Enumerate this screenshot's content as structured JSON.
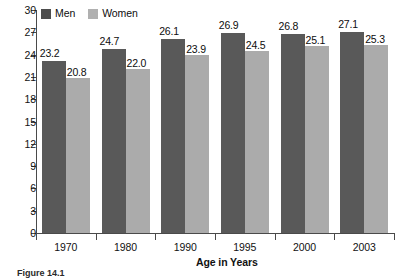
{
  "chart_data": {
    "type": "bar",
    "title": "",
    "xlabel": "Age in Years",
    "ylabel": "",
    "categories": [
      "1970",
      "1980",
      "1990",
      "1995",
      "2000",
      "2003"
    ],
    "series": [
      {
        "name": "Men",
        "color": "#595959",
        "values": [
          23.2,
          24.7,
          26.1,
          26.9,
          26.8,
          27.1
        ]
      },
      {
        "name": "Women",
        "color": "#ababab",
        "values": [
          20.8,
          22.0,
          23.9,
          24.5,
          25.1,
          25.3
        ]
      }
    ],
    "value_labels": {
      "Men": [
        "23.2",
        "24.7",
        "26.1",
        "26.9",
        "26.8",
        "27.1"
      ],
      "Women": [
        "20.8",
        "22.0",
        "23.9",
        "24.5",
        "25.1",
        "25.3"
      ]
    },
    "ylim": [
      0,
      30
    ],
    "yticks": [
      "0",
      "3",
      "6",
      "9",
      "12",
      "15",
      "18",
      "21",
      "24",
      "27",
      "30"
    ],
    "ytick_values": [
      0,
      3,
      6,
      9,
      12,
      15,
      18,
      21,
      24,
      27,
      30
    ],
    "grid": false,
    "legend_position": "top-left"
  },
  "legend": {
    "items": [
      {
        "label": "Men",
        "swatch": "men"
      },
      {
        "label": "Women",
        "swatch": "women"
      }
    ]
  },
  "axis": {
    "x_title": "Age in Years"
  },
  "caption": {
    "text": "Figure 14.1"
  }
}
